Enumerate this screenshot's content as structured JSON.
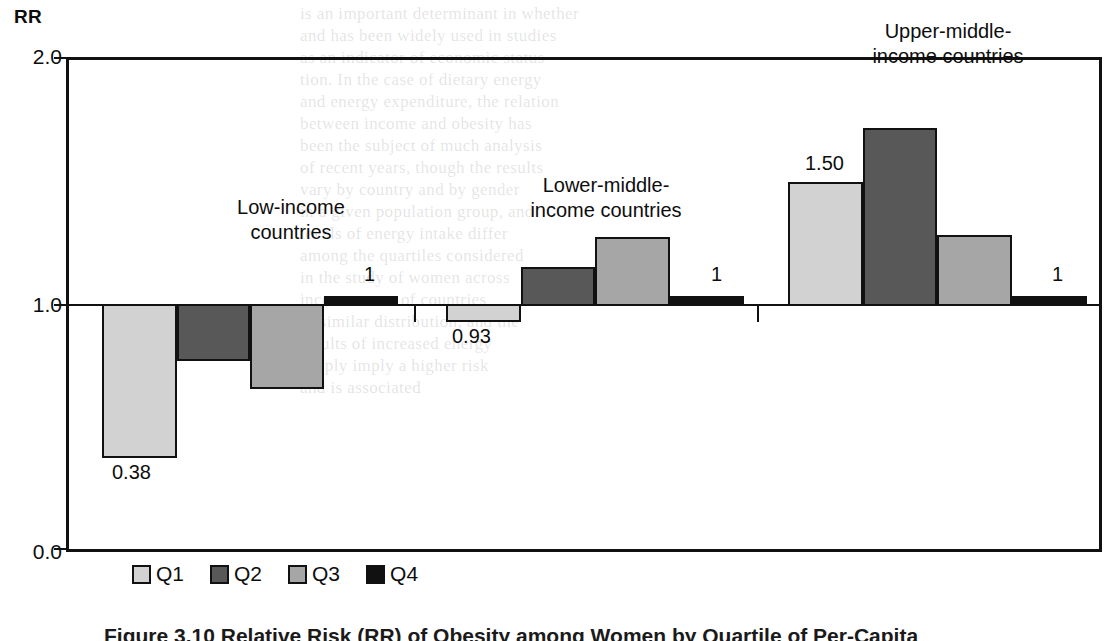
{
  "figure": {
    "y_axis_title": "RR",
    "caption": "Figure 3.10  Relative Risk (RR) of Obesity among Women by Quartile of Per-Capita"
  },
  "legend": {
    "items": [
      {
        "key": "q1",
        "label": "Q1",
        "color": "#d2d2d2"
      },
      {
        "key": "q2",
        "label": "Q2",
        "color": "#585858"
      },
      {
        "key": "q3",
        "label": "Q3",
        "color": "#a6a6a6"
      },
      {
        "key": "q4",
        "label": "Q4",
        "color": "#111111"
      }
    ]
  },
  "ticks": [
    {
      "label": "2.0",
      "value": 2.0
    },
    {
      "label": "1.0",
      "value": 1.0
    },
    {
      "label": "0.0",
      "value": 0.0
    }
  ],
  "groups": [
    {
      "name": "Low-income countries",
      "line1": "Low-income",
      "line2": "countries"
    },
    {
      "name": "Lower-middle-income countries",
      "line1": "Lower-middle-",
      "line2": "income countries"
    },
    {
      "name": "Upper-middle-income countries",
      "line1": "Upper-middle-",
      "line2": "income countries"
    }
  ],
  "chart_data": {
    "type": "bar",
    "xlabel": "",
    "ylabel": "RR",
    "ylim": [
      0.0,
      2.0
    ],
    "baseline": 1.0,
    "grid": false,
    "legend_position": "bottom",
    "categories": [
      "Low-income countries",
      "Lower-middle-income countries",
      "Upper-middle-income countries"
    ],
    "series": [
      {
        "name": "Q1",
        "color": "#d2d2d2",
        "values": [
          0.38,
          0.93,
          1.5
        ]
      },
      {
        "name": "Q2",
        "color": "#585858",
        "values": [
          0.77,
          1.15,
          1.71
        ]
      },
      {
        "name": "Q3",
        "color": "#a6a6a6",
        "values": [
          0.66,
          1.27,
          1.28
        ]
      },
      {
        "name": "Q4",
        "color": "#111111",
        "values": [
          1.0,
          1.0,
          1.0
        ]
      }
    ],
    "data_labels": [
      {
        "group": 0,
        "series": "Q1",
        "text": "0.38"
      },
      {
        "group": 0,
        "series": "Q4",
        "text": "1"
      },
      {
        "group": 1,
        "series": "Q1",
        "text": "0.93"
      },
      {
        "group": 1,
        "series": "Q4",
        "text": "1"
      },
      {
        "group": 2,
        "series": "Q1",
        "text": "1.50"
      },
      {
        "group": 2,
        "series": "Q4",
        "text": "1"
      }
    ]
  },
  "bleed_text": [
    {
      "x": 300,
      "y": 4,
      "t": "is an important determinant in whether"
    },
    {
      "x": 300,
      "y": 26,
      "t": "and has been widely used in studies"
    },
    {
      "x": 300,
      "y": 48,
      "t": "as an indicator of economic status"
    },
    {
      "x": 300,
      "y": 70,
      "t": "tion. In the case of dietary energy"
    },
    {
      "x": 300,
      "y": 92,
      "t": "and energy expenditure, the relation"
    },
    {
      "x": 300,
      "y": 114,
      "t": "between income and obesity has"
    },
    {
      "x": 300,
      "y": 136,
      "t": "been the subject of much analysis"
    },
    {
      "x": 300,
      "y": 158,
      "t": "of recent years, though the results"
    },
    {
      "x": 300,
      "y": 180,
      "t": "vary by country and by gender"
    },
    {
      "x": 300,
      "y": 202,
      "t": "in a given population group, and"
    },
    {
      "x": 300,
      "y": 224,
      "t": "levels of energy intake differ"
    },
    {
      "x": 300,
      "y": 246,
      "t": "among the quartiles considered"
    },
    {
      "x": 300,
      "y": 268,
      "t": "in the study of women across"
    },
    {
      "x": 300,
      "y": 290,
      "t": "income strata of countries"
    },
    {
      "x": 300,
      "y": 312,
      "t": "of similar distribution, and the"
    },
    {
      "x": 300,
      "y": 334,
      "t": "results of increased energy"
    },
    {
      "x": 300,
      "y": 356,
      "t": "supply imply a higher risk"
    },
    {
      "x": 300,
      "y": 378,
      "t": "and is associated"
    }
  ]
}
